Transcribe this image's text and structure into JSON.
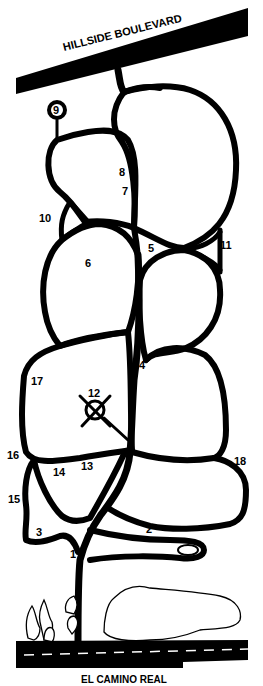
{
  "map": {
    "colors": {
      "ink": "#000000",
      "background": "#ffffff"
    },
    "roads": {
      "top": {
        "label": "HILLSIDE BOULEVARD"
      },
      "bottom": {
        "label": "EL CAMINO REAL"
      }
    },
    "sections": [
      {
        "id": "1",
        "label": "1",
        "x": 70,
        "y": 554
      },
      {
        "id": "2",
        "label": "2",
        "x": 146,
        "y": 533
      },
      {
        "id": "3",
        "label": "3",
        "x": 36,
        "y": 534
      },
      {
        "id": "4",
        "label": "4",
        "x": 140,
        "y": 369
      },
      {
        "id": "5",
        "label": "5",
        "x": 149,
        "y": 250
      },
      {
        "id": "6",
        "label": "6",
        "x": 85,
        "y": 266
      },
      {
        "id": "7",
        "label": "7",
        "x": 122,
        "y": 194
      },
      {
        "id": "8",
        "label": "8",
        "x": 119,
        "y": 175
      },
      {
        "id": "9",
        "label": "9",
        "x": 56,
        "y": 110
      },
      {
        "id": "10",
        "label": "10",
        "x": 39,
        "y": 220
      },
      {
        "id": "11",
        "label": "11",
        "x": 220,
        "y": 248
      },
      {
        "id": "12",
        "label": "12",
        "x": 88,
        "y": 395
      },
      {
        "id": "13",
        "label": "13",
        "x": 81,
        "y": 468
      },
      {
        "id": "14",
        "label": "14",
        "x": 53,
        "y": 475
      },
      {
        "id": "15",
        "label": "15",
        "x": 8,
        "y": 502
      },
      {
        "id": "16",
        "label": "16",
        "x": 7,
        "y": 458
      },
      {
        "id": "17",
        "label": "17",
        "x": 31,
        "y": 384
      },
      {
        "id": "18",
        "label": "18",
        "x": 234,
        "y": 464
      }
    ]
  }
}
